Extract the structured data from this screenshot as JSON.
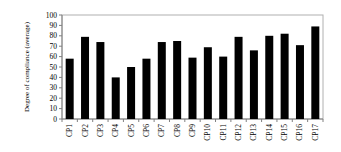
{
  "chart_data": {
    "type": "bar",
    "title": "",
    "xlabel": "",
    "ylabel": "Degree of compliance (average)",
    "ylim": [
      0,
      100
    ],
    "yticks": [
      0,
      10,
      20,
      30,
      40,
      50,
      60,
      70,
      80,
      90,
      100
    ],
    "grid": false,
    "legend": null,
    "categories": [
      "CP1",
      "CP2",
      "CP3",
      "CP4",
      "CP5",
      "CP6",
      "CP7",
      "CP8",
      "CP9",
      "CP10",
      "CP11",
      "CP12",
      "CP13",
      "CP14",
      "CP15",
      "CP16",
      "CP17"
    ],
    "values": [
      58,
      79,
      74,
      40,
      50,
      58,
      74,
      75,
      59,
      69,
      60,
      79,
      66,
      80,
      82,
      71,
      89
    ],
    "colors": {
      "bar": "#000000",
      "frame": "#b0b0b0",
      "axis": "#808080",
      "text": "#000000"
    }
  }
}
